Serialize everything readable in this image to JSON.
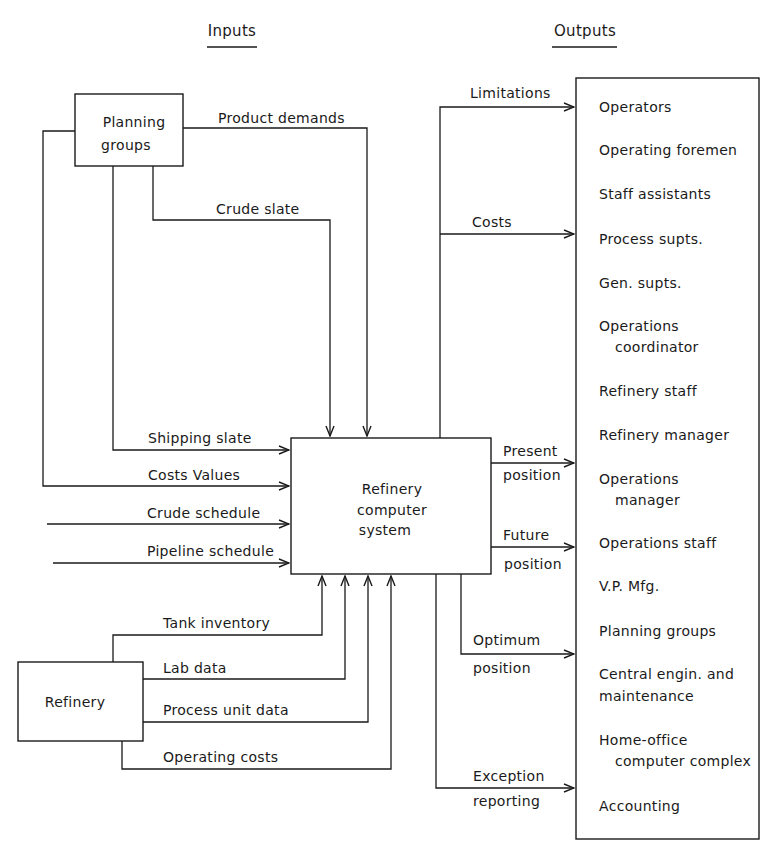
{
  "headers": {
    "inputs": "Inputs",
    "outputs": "Outputs"
  },
  "nodes": {
    "planning_groups": [
      "Planning",
      "groups"
    ],
    "refinery": "Refinery",
    "computer_system": [
      "Refinery",
      "computer",
      "system"
    ]
  },
  "inputs": {
    "product_demands": "Product demands",
    "crude_slate": "Crude slate",
    "shipping_slate": "Shipping slate",
    "costs_values": "Costs Values",
    "crude_schedule": "Crude schedule",
    "pipeline_schedule": "Pipeline schedule",
    "tank_inventory": "Tank inventory",
    "lab_data": "Lab data",
    "process_unit_data": "Process unit data",
    "operating_costs": "Operating costs"
  },
  "outputs": {
    "limitations": "Limitations",
    "costs": "Costs",
    "present_position": [
      "Present",
      "position"
    ],
    "future_position": [
      "Future",
      "position"
    ],
    "optimum_position": [
      "Optimum",
      "position"
    ],
    "exception_reporting": [
      "Exception",
      "reporting"
    ]
  },
  "recipients": [
    [
      "Operators"
    ],
    [
      "Operating foremen"
    ],
    [
      "Staff assistants"
    ],
    [
      "Process supts."
    ],
    [
      "Gen. supts."
    ],
    [
      "Operations",
      "coordinator"
    ],
    [
      "Refinery staff"
    ],
    [
      "Refinery manager"
    ],
    [
      "Operations",
      "manager"
    ],
    [
      "Operations staff"
    ],
    [
      "V.P. Mfg."
    ],
    [
      "Planning groups"
    ],
    [
      "Central engin. and",
      "maintenance"
    ],
    [
      "Home-office",
      "computer complex"
    ],
    [
      "Accounting"
    ]
  ],
  "colors": {
    "ink": "#1a1a1a",
    "background": "#ffffff"
  }
}
